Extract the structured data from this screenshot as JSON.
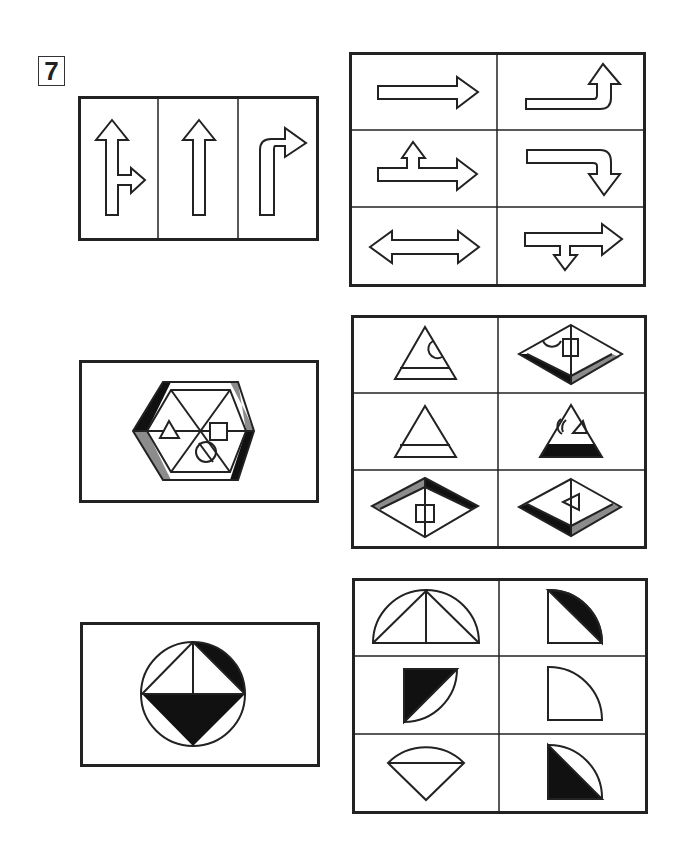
{
  "question": {
    "number": "7",
    "instructions": ""
  },
  "problems": [
    {
      "id": 1,
      "stem": {
        "description": "Three-panel road-sign strip",
        "panels": [
          "straight-and-right-arrow",
          "straight-arrow",
          "right-turn-arrow"
        ]
      },
      "options": [
        {
          "position": "r1c1",
          "description": "right-arrow"
        },
        {
          "position": "r1c2",
          "description": "right-then-up-arrow"
        },
        {
          "position": "r2c1",
          "description": "right-arrow-with-up-branch"
        },
        {
          "position": "r2c2",
          "description": "right-then-down-arrow"
        },
        {
          "position": "r3c1",
          "description": "double-headed-horizontal-arrow"
        },
        {
          "position": "r3c2",
          "description": "right-arrow-with-down-branch"
        }
      ]
    },
    {
      "id": 2,
      "stem": {
        "description": "Hexagon with 6 triangular sectors, shaded black/gray edges, triangle, square and circle symbols",
        "symbols": [
          "triangle",
          "square",
          "circle"
        ]
      },
      "options": [
        {
          "position": "r1c1",
          "description": "triangle-with-band-and-semicircle"
        },
        {
          "position": "r1c2",
          "description": "rhombus-with-square-semicircle-black-gray-edges"
        },
        {
          "position": "r2c1",
          "description": "triangle-with-band"
        },
        {
          "position": "r2c2",
          "description": "triangle-black-base-semicircle-triangle"
        },
        {
          "position": "r3c1",
          "description": "rhombus-gray-black-top-edges-square"
        },
        {
          "position": "r3c2",
          "description": "rhombus-black-gray-bottom-edges-triangle"
        }
      ]
    },
    {
      "id": 3,
      "stem": {
        "description": "Circle with inscribed square, black segment and black lower triangle"
      },
      "options": [
        {
          "position": "r1c1",
          "description": "semicircle-with-two-triangles"
        },
        {
          "position": "r1c2",
          "description": "quarter-circle-black-segment"
        },
        {
          "position": "r2c1",
          "description": "quarter-circle-black-triangle-rotated"
        },
        {
          "position": "r2c2",
          "description": "quarter-circle-plain"
        },
        {
          "position": "r3c1",
          "description": "sector-with-chord"
        },
        {
          "position": "r3c2",
          "description": "quarter-circle-black-lower-triangle"
        }
      ]
    }
  ],
  "colors": {
    "line": "#222222",
    "black_fill": "#111111",
    "gray_fill": "#8c8c8c",
    "background": "#ffffff"
  }
}
